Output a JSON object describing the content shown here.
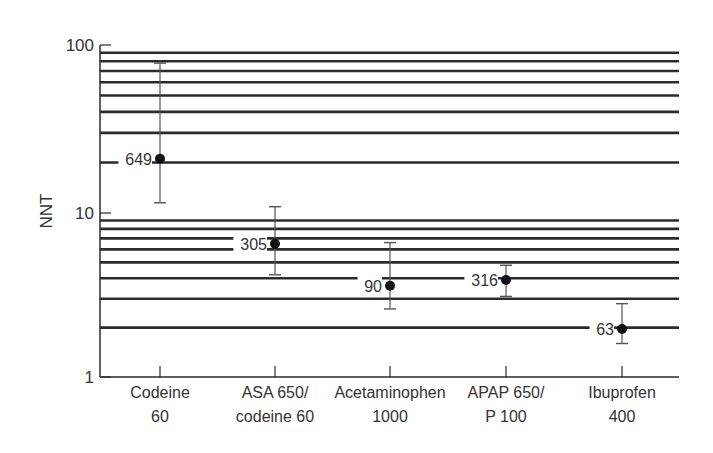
{
  "chart_data": {
    "type": "scatter",
    "title": "",
    "xlabel": "",
    "ylabel": "NNT",
    "yscale": "log",
    "ylim": [
      1,
      100
    ],
    "yticks": [
      "1",
      "10",
      "100"
    ],
    "grid": "horizontal log gridlines at 2-9 and 20-90",
    "categories": [
      {
        "line1": "Codeine",
        "line2": "60"
      },
      {
        "line1": "ASA 650/",
        "line2": "codeine 60"
      },
      {
        "line1": "Acetaminophen",
        "line2": "1000"
      },
      {
        "line1": "APAP 650/",
        "line2": "P 100"
      },
      {
        "line1": "Ibuprofen",
        "line2": "400"
      }
    ],
    "points": [
      {
        "category": "Codeine 60",
        "label": "649",
        "value": 21,
        "ci_low": 11.5,
        "ci_high": 78
      },
      {
        "category": "ASA 650/codeine 60",
        "label": "305",
        "value": 6.5,
        "ci_low": 4.2,
        "ci_high": 10.9
      },
      {
        "category": "Acetaminophen 1000",
        "label": "90",
        "value": 3.6,
        "ci_low": 2.6,
        "ci_high": 6.6
      },
      {
        "category": "APAP 650/P 100",
        "label": "316",
        "value": 3.9,
        "ci_low": 3.1,
        "ci_high": 4.8
      },
      {
        "category": "Ibuprofen 400",
        "label": "63",
        "value": 1.96,
        "ci_low": 1.6,
        "ci_high": 2.8
      }
    ]
  },
  "colors": {
    "line": "#2b2b2b",
    "text": "#333333",
    "background": "#ffffff"
  }
}
